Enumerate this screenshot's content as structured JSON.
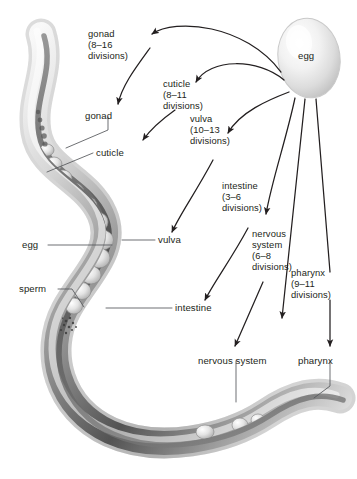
{
  "figure": {
    "organism": "C. elegans nematode",
    "egg_label": "egg"
  },
  "anatomy_labels": [
    {
      "id": "gonad",
      "text": "gonad"
    },
    {
      "id": "cuticle",
      "text": "cuticle"
    },
    {
      "id": "egg",
      "text": "egg"
    },
    {
      "id": "sperm",
      "text": "sperm"
    },
    {
      "id": "vulva",
      "text": "vulva"
    },
    {
      "id": "intestine",
      "text": "intestine"
    },
    {
      "id": "nervous-system",
      "text": "nervous system"
    },
    {
      "id": "pharynx",
      "text": "pharynx"
    }
  ],
  "lineage_annotations": [
    {
      "id": "gonad",
      "tissue": "gonad",
      "range": "(8–16",
      "divisions": "divisions)"
    },
    {
      "id": "cuticle",
      "tissue": "cuticle",
      "range": "(8–11",
      "divisions": "divisions)"
    },
    {
      "id": "vulva",
      "tissue": "vulva",
      "range": "(10–13",
      "divisions": "divisions)"
    },
    {
      "id": "intestine",
      "tissue": "intestine",
      "range": "(3–6",
      "divisions": "divisions)"
    },
    {
      "id": "nervous-system",
      "tissue": "nervous",
      "tissue2": "system",
      "range": "(6–8",
      "divisions": "divisions)"
    },
    {
      "id": "pharynx",
      "tissue": "pharynx",
      "range": "(9–11",
      "divisions": "divisions)"
    }
  ],
  "colors": {
    "ink": "#231f20",
    "leader": "#54565a",
    "background": "#ffffff"
  }
}
